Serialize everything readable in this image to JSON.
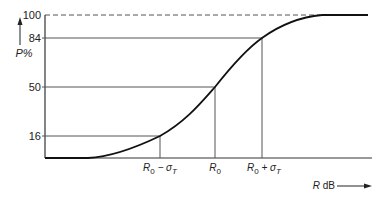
{
  "diagram": {
    "type": "cumulative-distribution-curve",
    "y_axis": {
      "label": "P%",
      "ticks": [
        "100",
        "84",
        "50",
        "16"
      ]
    },
    "x_axis": {
      "label_var": "R",
      "label_unit": " dB",
      "ticks": [
        {
          "main": "R",
          "sub": "0",
          "op": " − σ",
          "opsub": "T"
        },
        {
          "main": "R",
          "sub": "0",
          "op": "",
          "opsub": ""
        },
        {
          "main": "R",
          "sub": "0",
          "op": " + σ",
          "opsub": "T"
        }
      ]
    },
    "colors": {
      "line": "#1a1a1a",
      "guide": "#555555"
    }
  }
}
